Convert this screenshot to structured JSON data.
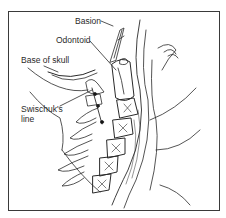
{
  "figure": {
    "labels": {
      "basion": "Basion",
      "odontoid": "Odontoid",
      "base_of_skull": "Base of skull",
      "swischuk_line_1": "Swischuk's",
      "swischuk_line_2": "line"
    },
    "colors": {
      "ink": "#2a2a2a",
      "frame": "#3a3a3a",
      "background": "#ffffff"
    }
  }
}
